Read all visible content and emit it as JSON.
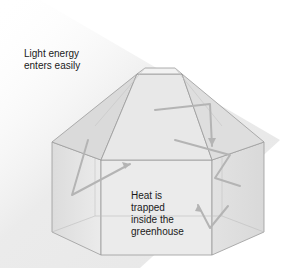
{
  "diagram": {
    "labels": {
      "light": [
        "Light energy",
        "enters easily"
      ],
      "heat": [
        "Heat is",
        "trapped",
        "inside the",
        "greenhouse"
      ]
    },
    "colors": {
      "background": "#ffffff",
      "light_beam": "#ececec",
      "glass_fill": "#e6e6e6",
      "glass_edge": "#9a9a9a",
      "arrow": "#b4b4b4",
      "text": "#1a1a1a"
    }
  }
}
